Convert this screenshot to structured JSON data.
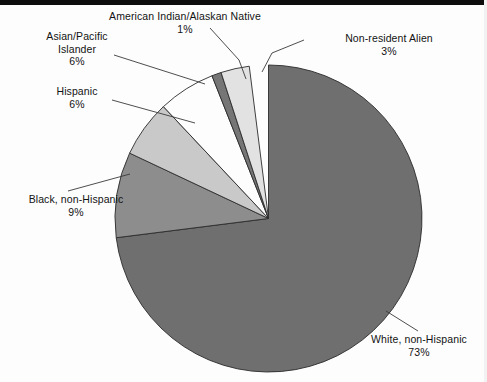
{
  "chart_data": {
    "type": "pie",
    "title": "",
    "subtitle": "",
    "xlabel": "",
    "ylabel": "",
    "legend_position": "none",
    "labels_position": "callout-outside",
    "grid": false,
    "total_percent": 98,
    "categories": [
      "White, non-Hispanic",
      "Black, non-Hispanic",
      "Hispanic",
      "Asian/Pacific Islander",
      "American Indian/Alaskan Native",
      "Non-resident Alien"
    ],
    "values": [
      73,
      9,
      6,
      6,
      1,
      3
    ],
    "slices": [
      {
        "name": "white-non-hispanic",
        "label": "White, non-Hispanic",
        "label_lines": [
          "White, non-Hispanic"
        ],
        "percent_text": "73%",
        "value": 73,
        "color": "#6f6f6f",
        "start_angle_deg": 0,
        "end_angle_deg": 262.8
      },
      {
        "name": "black-non-hispanic",
        "label": "Black, non-Hispanic",
        "label_lines": [
          "Black, non-Hispanic"
        ],
        "percent_text": "9%",
        "value": 9,
        "color": "#8d8d8d",
        "start_angle_deg": 262.8,
        "end_angle_deg": 295.2
      },
      {
        "name": "hispanic",
        "label": "Hispanic",
        "label_lines": [
          "Hispanic"
        ],
        "percent_text": "6%",
        "value": 6,
        "color": "#c9c9c9",
        "start_angle_deg": 295.2,
        "end_angle_deg": 316.8
      },
      {
        "name": "asian-pacific-islander",
        "label": "Asian/Pacific Islander",
        "label_lines": [
          "Asian/Pacific",
          "Islander"
        ],
        "percent_text": "6%",
        "value": 6,
        "color": "#fdfdfd",
        "start_angle_deg": 316.8,
        "end_angle_deg": 338.4
      },
      {
        "name": "american-indian-alaskan-native",
        "label": "American Indian/Alaskan Native",
        "label_lines": [
          "American Indian/Alaskan Native"
        ],
        "percent_text": "1%",
        "value": 1,
        "color": "#767676",
        "start_angle_deg": 338.4,
        "end_angle_deg": 342.0
      },
      {
        "name": "non-resident-alien",
        "label": "Non-resident Alien",
        "label_lines": [
          "Non-resident Alien"
        ],
        "percent_text": "3%",
        "value": 3,
        "color": "#e2e2e2",
        "start_angle_deg": 342.0,
        "end_angle_deg": 352.8
      }
    ]
  },
  "colors": {
    "outline": "#2b2b2b",
    "leader_line": "#3a3a3a",
    "text": "#131313",
    "background": "#fdfdfd",
    "scan_bar": "#0d0d0d"
  },
  "labels": {
    "american_indian": {
      "line1": "American Indian/Alaskan Native",
      "percent": "1%"
    },
    "asian_pacific": {
      "line1": "Asian/Pacific",
      "line2": "Islander",
      "percent": "6%"
    },
    "hispanic": {
      "line1": "Hispanic",
      "percent": "6%"
    },
    "black": {
      "line1": "Black, non-Hispanic",
      "percent": "9%"
    },
    "non_resident": {
      "line1": "Non-resident Alien",
      "percent": "3%"
    },
    "white": {
      "line1": "White, non-Hispanic",
      "percent": "73%"
    }
  }
}
